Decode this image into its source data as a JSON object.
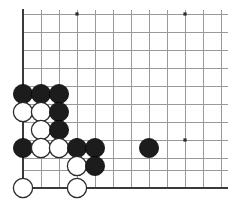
{
  "board": {
    "title": "Go board corner position",
    "style": "line-drawing",
    "background_color": "#ffffff",
    "grid_color": "#9a9a9a",
    "edge_color": "#3a3a3a",
    "black_stone_color": "#1c1c1c",
    "white_stone_color": "#ffffff",
    "white_stone_outline": "#2b2b2b",
    "corner": "lower-left",
    "stone_radius": 9.6,
    "cell_size": 18,
    "origin": {
      "x": 23,
      "y": 188
    },
    "columns_visible": 12,
    "rows_visible": 11,
    "vertical_lines_x": [
      23,
      41,
      59,
      77,
      95,
      113,
      131,
      149,
      167,
      185,
      203,
      221
    ],
    "horizontal_lines_y": [
      14,
      32,
      50,
      68,
      86,
      104,
      122,
      140,
      158,
      170,
      188
    ],
    "edges": [
      {
        "name": "left-edge",
        "orientation": "vertical",
        "x": 23
      },
      {
        "name": "bottom-edge",
        "orientation": "horizontal",
        "y": 188
      }
    ],
    "star_points": [
      {
        "label": "hoshi-upper-left",
        "x": 77,
        "y": 14
      },
      {
        "label": "hoshi-upper-right",
        "x": 185,
        "y": 14
      },
      {
        "label": "hoshi-lower-left",
        "x": 77,
        "y": 140
      },
      {
        "label": "hoshi-lower-right",
        "x": 185,
        "y": 140
      }
    ],
    "stones": [
      {
        "id": "b1",
        "color": "black",
        "x": 23,
        "y": 94
      },
      {
        "id": "b2",
        "color": "black",
        "x": 41,
        "y": 94
      },
      {
        "id": "b3",
        "color": "black",
        "x": 59,
        "y": 94
      },
      {
        "id": "w1",
        "color": "white",
        "x": 23,
        "y": 112
      },
      {
        "id": "w2",
        "color": "white",
        "x": 41,
        "y": 112
      },
      {
        "id": "b4",
        "color": "black",
        "x": 59,
        "y": 112
      },
      {
        "id": "w3",
        "color": "white",
        "x": 41,
        "y": 130
      },
      {
        "id": "b5",
        "color": "black",
        "x": 59,
        "y": 130
      },
      {
        "id": "b6",
        "color": "black",
        "x": 23,
        "y": 148
      },
      {
        "id": "w4",
        "color": "white",
        "x": 41,
        "y": 148
      },
      {
        "id": "w5",
        "color": "white",
        "x": 59,
        "y": 148
      },
      {
        "id": "b7",
        "color": "black",
        "x": 77,
        "y": 148
      },
      {
        "id": "b8",
        "color": "black",
        "x": 95,
        "y": 148
      },
      {
        "id": "b9",
        "color": "black",
        "x": 149,
        "y": 148
      },
      {
        "id": "w6",
        "color": "white",
        "x": 77,
        "y": 166
      },
      {
        "id": "b10",
        "color": "black",
        "x": 95,
        "y": 166
      },
      {
        "id": "w7",
        "color": "white",
        "x": 23,
        "y": 188
      },
      {
        "id": "w8",
        "color": "white",
        "x": 77,
        "y": 188
      }
    ],
    "counts": {
      "black": 10,
      "white": 8,
      "total": 18
    }
  }
}
